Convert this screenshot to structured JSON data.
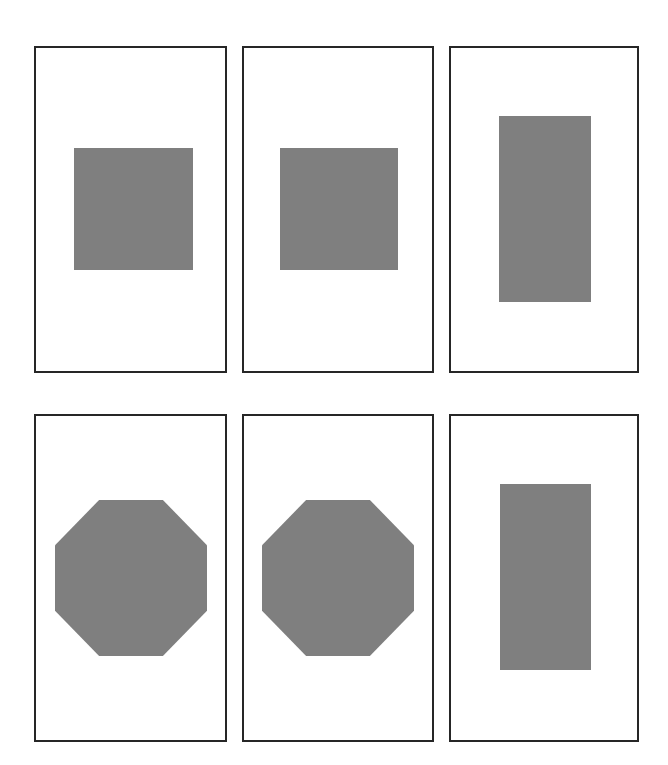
{
  "figure": {
    "colors": {
      "frame": "#262626",
      "shape_fill": "#7f7f7f",
      "background": "#ffffff"
    },
    "panels": [
      {
        "row": 1,
        "col": 1,
        "shape": "square",
        "frame": [
          34,
          46,
          193,
          327
        ],
        "shape_box": [
          74,
          148,
          119,
          122
        ]
      },
      {
        "row": 1,
        "col": 2,
        "shape": "square",
        "frame": [
          242,
          46,
          192,
          327
        ],
        "shape_box": [
          280,
          148,
          118,
          122
        ]
      },
      {
        "row": 1,
        "col": 3,
        "shape": "tall-rectangle",
        "frame": [
          449,
          46,
          190,
          327
        ],
        "shape_box": [
          499,
          116,
          92,
          186
        ]
      },
      {
        "row": 2,
        "col": 1,
        "shape": "octagon",
        "frame": [
          34,
          414,
          193,
          328
        ],
        "shape_box": [
          55,
          500,
          152,
          156
        ]
      },
      {
        "row": 2,
        "col": 2,
        "shape": "octagon",
        "frame": [
          242,
          414,
          192,
          328
        ],
        "shape_box": [
          262,
          500,
          152,
          156
        ]
      },
      {
        "row": 2,
        "col": 3,
        "shape": "tall-rectangle",
        "frame": [
          449,
          414,
          190,
          328
        ],
        "shape_box": [
          500,
          484,
          91,
          186
        ]
      }
    ]
  }
}
